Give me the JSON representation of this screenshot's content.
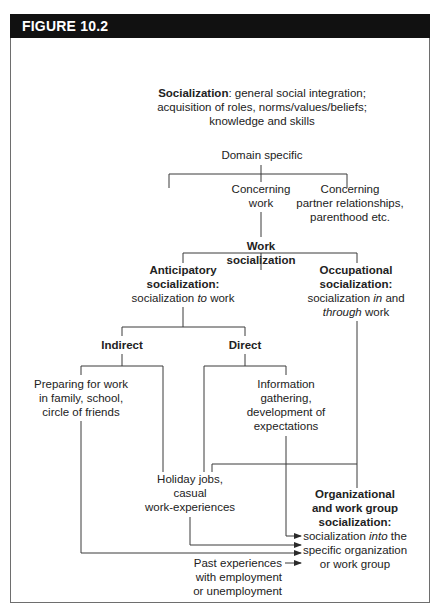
{
  "figure": {
    "title": "FIGURE 10.2",
    "header_color": "#111111"
  },
  "nodes": {
    "socialization": {
      "term": "Socialization",
      "line1_rest": ": general social integration;",
      "line2": "acquisition of roles, norms/values/beliefs;",
      "line3": "knowledge and skills"
    },
    "domain_specific": {
      "label": "Domain specific"
    },
    "concerning_work": {
      "line1": "Concerning",
      "line2": "work"
    },
    "concerning_partner": {
      "line1": "Concerning",
      "line2": "partner relationships,",
      "line3": "parenthood etc."
    },
    "work_socialization": {
      "line1": "Work",
      "line2": "socialization"
    },
    "anticipatory": {
      "line1": "Anticipatory",
      "line2": "socialization:",
      "line3_pre": "socialization ",
      "line3_em": "to",
      "line3_post": " work"
    },
    "occupational": {
      "line1": "Occupational",
      "line2": "socialization:",
      "line3_pre": "socialization ",
      "line3_em": "in",
      "line3_post": " and",
      "line4_em": "through",
      "line4_post": " work"
    },
    "indirect": {
      "label": "Indirect"
    },
    "direct": {
      "label": "Direct"
    },
    "preparing": {
      "line1": "Preparing for work",
      "line2": "in family, school,",
      "line3": "circle of friends"
    },
    "information": {
      "line1": "Information",
      "line2": "gathering,",
      "line3": "development of",
      "line4": "expectations"
    },
    "holiday": {
      "line1": "Holiday jobs,",
      "line2": "casual",
      "line3": "work-experiences"
    },
    "organizational": {
      "line1": "Organizational",
      "line2": "and work group",
      "line3": "socialization:",
      "line4_pre": "socialization ",
      "line4_em": "into",
      "line4_post": " the",
      "line5": "specific organization",
      "line6": "or work group"
    },
    "past": {
      "line1": "Past experiences",
      "line2": "with employment",
      "line3": "or unemployment"
    }
  }
}
